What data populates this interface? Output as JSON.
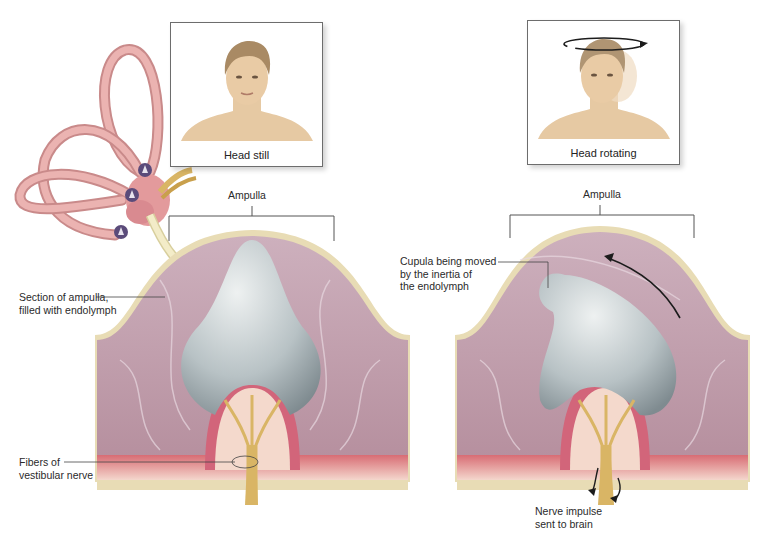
{
  "figure": {
    "left_panel": {
      "caption": "Head still",
      "ampulla_label": "Ampulla",
      "callouts": [
        {
          "line1": "Section of ampulla,",
          "line2": "filled with endolymph"
        },
        {
          "line1": "Fibers of",
          "line2": "vestibular nerve"
        }
      ]
    },
    "right_panel": {
      "caption": "Head rotating",
      "ampulla_label": "Ampulla",
      "callouts": [
        {
          "line1": "Cupula being moved",
          "line2": "by the inertia of",
          "line3": "the endolymph"
        },
        {
          "line1": "Nerve impulse",
          "line2": "sent to brain"
        }
      ]
    },
    "colors": {
      "endolymph": "#c9a9b5",
      "wall": "#e8dcb5",
      "cupula": "#b9c3c6",
      "hair_cells": "#d46b79",
      "nerve": "#d9b565",
      "canal": "#e4a2a2"
    }
  }
}
